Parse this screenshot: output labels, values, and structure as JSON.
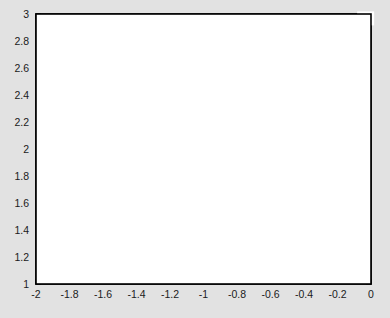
{
  "figure": {
    "background_color": "#e2e2e2",
    "plot_background_color": "#ffffff",
    "frame_color": "#000000",
    "contour_color": "#000000",
    "arrow_color": "#4a4a4a"
  },
  "chart_data": {
    "type": "line",
    "title": "",
    "xlabel": "",
    "ylabel": "",
    "xlim": [
      -2,
      0
    ],
    "ylim": [
      1,
      3
    ],
    "grid": false,
    "legend": null,
    "xticks": [
      -2,
      -1.8,
      -1.6,
      -1.4,
      -1.2,
      -1,
      -0.8,
      -0.6,
      -0.4,
      -0.2,
      0
    ],
    "xtick_labels": [
      "-2",
      "-1.8",
      "-1.6",
      "-1.4",
      "-1.2",
      "-1",
      "-0.8",
      "-0.6",
      "-0.4",
      "-0.2",
      "0"
    ],
    "yticks": [
      1,
      1.2,
      1.4,
      1.6,
      1.8,
      2,
      2.2,
      2.4,
      2.6,
      2.8,
      3
    ],
    "ytick_labels": [
      "1",
      "1.2",
      "1.4",
      "1.6",
      "1.8",
      "2",
      "2.2",
      "2.4",
      "2.6",
      "2.8",
      "3"
    ],
    "contour_levels": [
      1,
      0,
      -1,
      -2,
      -3,
      -4,
      -5
    ],
    "contour_labels": [
      {
        "level": "1",
        "x": -1.02,
        "y": 2.02
      },
      {
        "level": "0",
        "x": -0.845,
        "y": 2.555
      },
      {
        "level": "-1",
        "x": -0.575,
        "y": 2.58
      },
      {
        "level": "-2",
        "x": -0.275,
        "y": 2.67
      },
      {
        "level": "-3",
        "x": -0.115,
        "y": 2.655
      },
      {
        "level": "-4",
        "x": -0.13,
        "y": 2.92
      },
      {
        "level": "0",
        "x": -1.905,
        "y": 1.66
      },
      {
        "level": "-1",
        "x": -1.945,
        "y": 1.39
      },
      {
        "level": "-5",
        "x": -0.035,
        "y": 2.96
      }
    ],
    "contours": [
      {
        "level": "1-closed-loop",
        "points": [
          [
            -1.47,
            2.0
          ],
          [
            -1.25,
            2.16
          ],
          [
            -1.05,
            2.01
          ],
          [
            -0.93,
            1.75
          ],
          [
            -0.84,
            1.45
          ],
          [
            -0.77,
            1.18
          ],
          [
            -0.73,
            1.0
          ]
        ]
      },
      {
        "level": "1-left-branch",
        "points": [
          [
            -1.47,
            2.0
          ],
          [
            -1.44,
            1.78
          ],
          [
            -1.39,
            1.52
          ],
          [
            -1.3,
            1.3
          ],
          [
            -1.18,
            1.11
          ],
          [
            -1.1,
            1.0
          ]
        ]
      },
      {
        "level": "0-main",
        "points": [
          [
            -1.37,
            3.0
          ],
          [
            -1.17,
            2.83
          ],
          [
            -0.98,
            2.67
          ],
          [
            -0.8,
            2.49
          ],
          [
            -0.66,
            2.3
          ],
          [
            -0.56,
            2.08
          ],
          [
            -0.49,
            1.85
          ],
          [
            -0.44,
            1.6
          ],
          [
            -0.42,
            1.35
          ],
          [
            -0.43,
            1.12
          ],
          [
            -0.46,
            1.0
          ]
        ]
      },
      {
        "level": "-1-main",
        "points": [
          [
            -0.92,
            3.0
          ],
          [
            -0.72,
            2.82
          ],
          [
            -0.55,
            2.63
          ],
          [
            -0.4,
            2.42
          ],
          [
            -0.28,
            2.18
          ],
          [
            -0.2,
            1.93
          ],
          [
            -0.15,
            1.66
          ],
          [
            -0.13,
            1.4
          ],
          [
            -0.13,
            1.14
          ],
          [
            -0.15,
            1.0
          ]
        ]
      },
      {
        "level": "-2-main",
        "points": [
          [
            -0.58,
            3.0
          ],
          [
            -0.42,
            2.82
          ],
          [
            -0.28,
            2.6
          ],
          [
            -0.17,
            2.38
          ],
          [
            -0.09,
            2.14
          ],
          [
            -0.04,
            1.9
          ],
          [
            -0.01,
            1.68
          ],
          [
            0.0,
            1.55
          ]
        ]
      },
      {
        "level": "-3-main",
        "points": [
          [
            -0.33,
            3.0
          ],
          [
            -0.21,
            2.84
          ],
          [
            -0.11,
            2.66
          ],
          [
            -0.04,
            2.48
          ],
          [
            0.0,
            2.33
          ]
        ]
      },
      {
        "level": "-4-main",
        "points": [
          [
            -0.17,
            3.0
          ],
          [
            -0.08,
            2.87
          ],
          [
            -0.02,
            2.76
          ],
          [
            0.0,
            2.71
          ]
        ]
      },
      {
        "level": "-5-main",
        "points": [
          [
            -0.06,
            3.0
          ],
          [
            -0.01,
            2.93
          ],
          [
            0.0,
            2.91
          ]
        ]
      },
      {
        "level": "0-lower-left",
        "points": [
          [
            -2.0,
            2.0
          ],
          [
            -1.94,
            1.82
          ],
          [
            -1.88,
            1.62
          ],
          [
            -1.84,
            1.4
          ],
          [
            -1.8,
            1.2
          ],
          [
            -1.77,
            1.0
          ]
        ]
      },
      {
        "level": "-1-lower-left",
        "points": [
          [
            -2.0,
            1.4
          ],
          [
            -1.93,
            1.24
          ],
          [
            -1.86,
            1.09
          ],
          [
            -1.81,
            1.0
          ]
        ]
      },
      {
        "level": "0-mid-lower",
        "points": [
          [
            -1.72,
            2.94
          ],
          [
            -1.67,
            2.7
          ],
          [
            -1.62,
            2.45
          ],
          [
            -1.6,
            2.2
          ],
          [
            -1.59,
            1.95
          ],
          [
            -1.57,
            1.7
          ],
          [
            -1.54,
            1.42
          ],
          [
            -1.5,
            1.16
          ],
          [
            -1.47,
            1.0
          ]
        ]
      }
    ],
    "vector_field": {
      "description": "arrow grid overlay showing gradient direction",
      "grid_x": [
        -1.85,
        -1.6,
        -1.36,
        -1.12,
        -0.88,
        -0.64,
        -0.4,
        -0.16
      ],
      "grid_y": [
        2.8,
        2.55,
        2.3,
        2.05,
        1.8,
        1.55,
        1.3,
        1.06
      ],
      "arrows": [
        {
          "x": -1.85,
          "y": 2.8,
          "dx": -0.28,
          "dy": -0.6
        },
        {
          "x": -1.6,
          "y": 2.8,
          "dx": 0.2,
          "dy": 0.68
        },
        {
          "x": -1.36,
          "y": 2.8,
          "dx": 0.42,
          "dy": 0.6
        },
        {
          "x": -1.12,
          "y": 2.8,
          "dx": 0.62,
          "dy": 0.44
        },
        {
          "x": -0.88,
          "y": 2.8,
          "dx": 0.72,
          "dy": 0.3
        },
        {
          "x": -0.64,
          "y": 2.8,
          "dx": 0.78,
          "dy": 0.22
        },
        {
          "x": -0.4,
          "y": 2.8,
          "dx": 0.8,
          "dy": 0.16
        },
        {
          "x": -0.16,
          "y": 2.8,
          "dx": 0.8,
          "dy": 0.12
        },
        {
          "x": -1.85,
          "y": 2.55,
          "dx": -0.38,
          "dy": 0.4
        },
        {
          "x": -1.6,
          "y": 2.55,
          "dx": 0.02,
          "dy": 0.72
        },
        {
          "x": -1.36,
          "y": 2.55,
          "dx": 0.34,
          "dy": 0.64
        },
        {
          "x": -1.12,
          "y": 2.55,
          "dx": 0.56,
          "dy": 0.5
        },
        {
          "x": -0.88,
          "y": 2.55,
          "dx": 0.7,
          "dy": 0.36
        },
        {
          "x": -0.64,
          "y": 2.55,
          "dx": 0.78,
          "dy": 0.26
        },
        {
          "x": -0.4,
          "y": 2.55,
          "dx": 0.8,
          "dy": 0.2
        },
        {
          "x": -0.16,
          "y": 2.55,
          "dx": 0.82,
          "dy": 0.16
        },
        {
          "x": -1.85,
          "y": 2.3,
          "dx": -0.66,
          "dy": 0.04
        },
        {
          "x": -1.6,
          "y": 2.3,
          "dx": -0.3,
          "dy": -0.44
        },
        {
          "x": -1.36,
          "y": 2.3,
          "dx": 0.24,
          "dy": 0.6
        },
        {
          "x": -1.12,
          "y": 2.3,
          "dx": 0.5,
          "dy": 0.52
        },
        {
          "x": -0.88,
          "y": 2.3,
          "dx": 0.66,
          "dy": 0.42
        },
        {
          "x": -0.64,
          "y": 2.3,
          "dx": 0.76,
          "dy": 0.3
        },
        {
          "x": -0.4,
          "y": 2.3,
          "dx": 0.82,
          "dy": 0.22
        },
        {
          "x": -0.16,
          "y": 2.3,
          "dx": 0.84,
          "dy": 0.18
        },
        {
          "x": -1.85,
          "y": 2.05,
          "dx": -0.68,
          "dy": 0.02
        },
        {
          "x": -1.6,
          "y": 2.05,
          "dx": -0.6,
          "dy": 0.04
        },
        {
          "x": -1.36,
          "y": 2.05,
          "dx": 0.04,
          "dy": 0.7
        },
        {
          "x": -1.12,
          "y": 2.05,
          "dx": 0.22,
          "dy": 0.58
        },
        {
          "x": -0.88,
          "y": 2.05,
          "dx": 0.6,
          "dy": 0.4
        },
        {
          "x": -0.64,
          "y": 2.05,
          "dx": 0.72,
          "dy": 0.32
        },
        {
          "x": -0.4,
          "y": 2.05,
          "dx": 0.8,
          "dy": 0.26
        },
        {
          "x": -0.16,
          "y": 2.05,
          "dx": 0.84,
          "dy": 0.2
        },
        {
          "x": -1.85,
          "y": 1.8,
          "dx": -0.6,
          "dy": 0.2
        },
        {
          "x": -1.6,
          "y": 1.8,
          "dx": -0.58,
          "dy": -0.08
        },
        {
          "x": -1.36,
          "y": 1.8,
          "dx": -0.36,
          "dy": 0.02
        },
        {
          "x": -1.12,
          "y": 1.8,
          "dx": 0.34,
          "dy": 0.5
        },
        {
          "x": -0.88,
          "y": 1.8,
          "dx": 0.62,
          "dy": 0.36
        },
        {
          "x": -0.64,
          "y": 1.8,
          "dx": 0.74,
          "dy": 0.28
        },
        {
          "x": -0.4,
          "y": 1.8,
          "dx": 0.8,
          "dy": 0.24
        },
        {
          "x": -0.16,
          "y": 1.8,
          "dx": 0.82,
          "dy": 0.22
        },
        {
          "x": -1.85,
          "y": 1.55,
          "dx": -0.6,
          "dy": 0.2
        },
        {
          "x": -1.6,
          "y": 1.55,
          "dx": -0.56,
          "dy": -0.14
        },
        {
          "x": -1.36,
          "y": 1.55,
          "dx": -0.32,
          "dy": -0.06
        },
        {
          "x": -1.12,
          "y": 1.55,
          "dx": 0.36,
          "dy": 0.18
        },
        {
          "x": -0.88,
          "y": 1.55,
          "dx": 0.66,
          "dy": 0.3
        },
        {
          "x": -0.64,
          "y": 1.55,
          "dx": 0.76,
          "dy": 0.26
        },
        {
          "x": -0.4,
          "y": 1.55,
          "dx": 0.8,
          "dy": 0.24
        },
        {
          "x": -0.16,
          "y": 1.55,
          "dx": 0.82,
          "dy": 0.24
        },
        {
          "x": -1.85,
          "y": 1.3,
          "dx": -0.5,
          "dy": 0.3
        },
        {
          "x": -1.6,
          "y": 1.3,
          "dx": -0.52,
          "dy": -0.2
        },
        {
          "x": -1.36,
          "y": 1.3,
          "dx": -0.3,
          "dy": -0.14
        },
        {
          "x": -1.12,
          "y": 1.3,
          "dx": 0.46,
          "dy": 0.3
        },
        {
          "x": -0.88,
          "y": 1.3,
          "dx": 0.74,
          "dy": 0.1
        },
        {
          "x": -0.64,
          "y": 1.3,
          "dx": 0.78,
          "dy": 0.2
        },
        {
          "x": -0.4,
          "y": 1.3,
          "dx": 0.8,
          "dy": 0.24
        },
        {
          "x": -0.16,
          "y": 1.3,
          "dx": 0.8,
          "dy": 0.26
        },
        {
          "x": -1.85,
          "y": 1.06,
          "dx": -0.4,
          "dy": 0.38
        },
        {
          "x": -1.6,
          "y": 1.06,
          "dx": -0.5,
          "dy": -0.24
        },
        {
          "x": -1.36,
          "y": 1.06,
          "dx": -0.3,
          "dy": -0.2
        },
        {
          "x": -1.12,
          "y": 1.06,
          "dx": 0.38,
          "dy": -0.22
        },
        {
          "x": -0.88,
          "y": 1.06,
          "dx": 0.7,
          "dy": 0.06
        },
        {
          "x": -0.64,
          "y": 1.06,
          "dx": 0.76,
          "dy": 0.1
        },
        {
          "x": -0.4,
          "y": 1.06,
          "dx": 0.78,
          "dy": 0.16
        },
        {
          "x": -0.16,
          "y": 1.06,
          "dx": 0.78,
          "dy": 0.18
        }
      ]
    }
  }
}
